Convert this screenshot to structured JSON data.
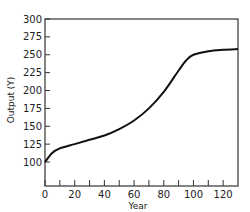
{
  "chart_data": {
    "type": "line",
    "title": "",
    "xlabel": "Year",
    "ylabel": "Output (Y)",
    "xlim": [
      0,
      130
    ],
    "ylim": [
      67,
      300
    ],
    "xticks": [
      0,
      20,
      40,
      60,
      80,
      100,
      120
    ],
    "xminor_ticks": [
      10,
      30,
      50,
      70,
      90,
      110
    ],
    "yticks": [
      100,
      125,
      150,
      175,
      200,
      225,
      250,
      275,
      300
    ],
    "grid": false,
    "legend": null,
    "series": [
      {
        "name": "Output",
        "x": [
          0,
          5,
          10,
          20,
          30,
          40,
          50,
          60,
          70,
          80,
          90,
          95,
          100,
          110,
          120,
          130
        ],
        "y": [
          100,
          113,
          119,
          125,
          131,
          137,
          146,
          158,
          175,
          198,
          228,
          242,
          250,
          255,
          257,
          258
        ]
      }
    ]
  }
}
